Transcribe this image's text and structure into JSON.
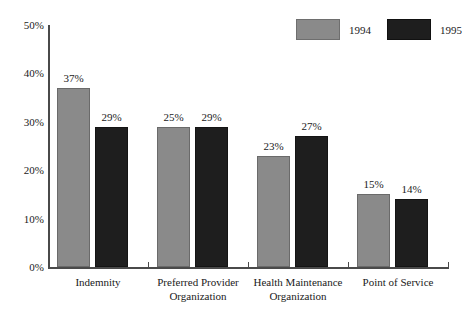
{
  "header": {
    "clipped_text": ""
  },
  "legend": {
    "position": "top-right",
    "entries": [
      {
        "label": "1994",
        "color": "#8a8a8a",
        "swatch_name": "legend-swatch-1994"
      },
      {
        "label": "1995",
        "color": "#1e1e1e",
        "swatch_name": "legend-swatch-1995"
      }
    ]
  },
  "axes": {
    "y_ticks": [
      "50%",
      "40%",
      "30%",
      "20%",
      "10%",
      "0%"
    ],
    "y_min": 0,
    "y_max": 50
  },
  "chart_data": {
    "type": "bar",
    "title": "",
    "subtitle": "",
    "xlabel": "",
    "ylabel": "",
    "ylim": [
      0,
      50
    ],
    "ytick_values": [
      0,
      10,
      20,
      30,
      40,
      50
    ],
    "ytick_labels": [
      "0%",
      "10%",
      "20%",
      "30%",
      "40%",
      "50%"
    ],
    "grid": false,
    "legend_position": "top-right",
    "value_format": "percent",
    "categories": [
      "Indemnity",
      "Preferred Provider Organization",
      "Health Maintenance Organization",
      "Point of Service"
    ],
    "category_lines": [
      [
        "Indemnity",
        ""
      ],
      [
        "Preferred Provider",
        "Organization"
      ],
      [
        "Health Maintenance",
        "Organization"
      ],
      [
        "Point of Service",
        ""
      ]
    ],
    "series": [
      {
        "name": "1994",
        "color": "#8a8a8a",
        "values": [
          37,
          29,
          23,
          15
        ],
        "labels": [
          "37%",
          "25%",
          "23%",
          "15%"
        ]
      },
      {
        "name": "1995",
        "color": "#1e1e1e",
        "values": [
          29,
          29,
          27,
          14
        ],
        "labels": [
          "29%",
          "29%",
          "27%",
          "14%"
        ]
      }
    ],
    "data_labels": {
      "Indemnity": {
        "1994": "37%",
        "1995": "29%"
      },
      "Preferred Provider Organization": {
        "1994": "25%",
        "1995": "29%"
      },
      "Health Maintenance Organization": {
        "1994": "23%",
        "1995": "27%"
      },
      "Point of Service": {
        "1994": "15%",
        "1995": "14%"
      }
    }
  }
}
